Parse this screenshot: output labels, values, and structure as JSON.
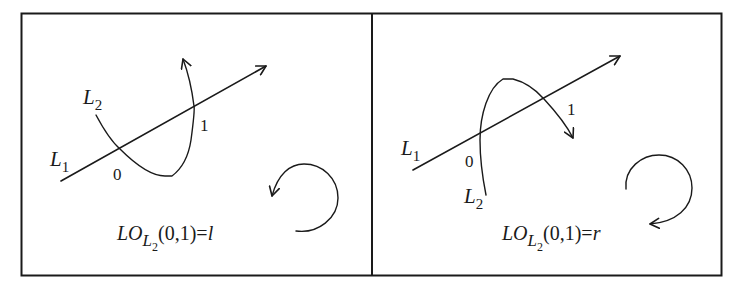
{
  "figure": {
    "panels": [
      {
        "id": "left",
        "line1_label": "L",
        "line1_sub": "1",
        "line2_label": "L",
        "line2_sub": "2",
        "point0_label": "0",
        "point1_label": "1",
        "rotation": "counterclockwise",
        "formula": {
          "prefix": "LO",
          "sub_main": "L",
          "sub_sub": "2",
          "args": "(0,1)=",
          "result": "l"
        }
      },
      {
        "id": "right",
        "line1_label": "L",
        "line1_sub": "1",
        "line2_label": "L",
        "line2_sub": "2",
        "point0_label": "0",
        "point1_label": "1",
        "rotation": "clockwise",
        "formula": {
          "prefix": "LO",
          "sub_main": "L",
          "sub_sub": "2",
          "args": "(0,1)=",
          "result": "r"
        }
      }
    ],
    "colors": {
      "ink": "#1a1a1a",
      "background": "#ffffff"
    }
  }
}
